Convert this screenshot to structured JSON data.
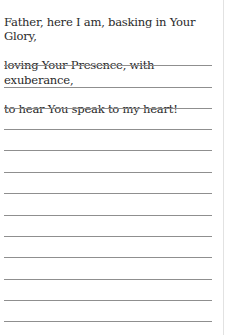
{
  "prompt": {
    "lines": [
      "Father, here I am, basking in Your Glory,",
      "loving Your Presence, with exuberance,",
      "to hear You speak to my heart!"
    ]
  },
  "writing_lines": {
    "count": 13
  },
  "colors": {
    "text": "#2a2a2a",
    "rule": "#8f8f8f",
    "page_edge": "#e2e2e2",
    "background": "#ffffff"
  }
}
